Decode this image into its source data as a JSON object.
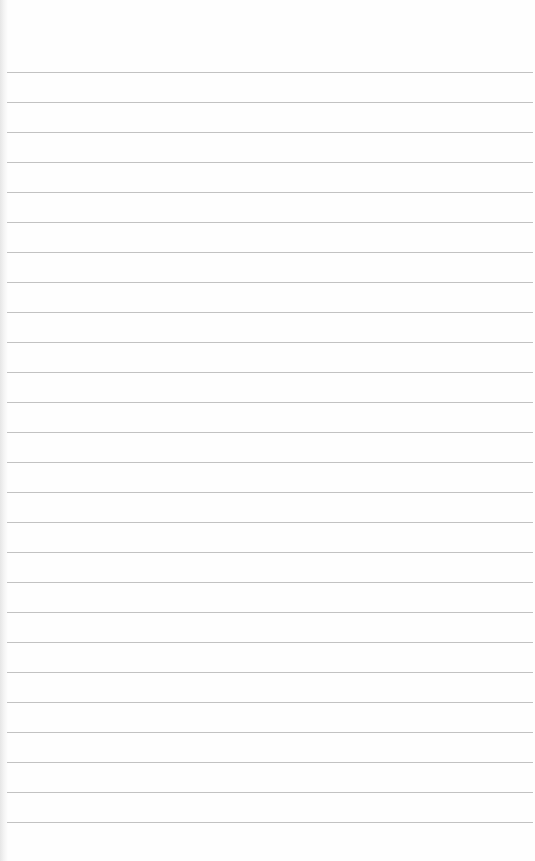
{
  "page": {
    "type": "ruled-notepad",
    "background_color": "#fefefe",
    "line_color": "#c2c2c2",
    "line_count": 26,
    "first_line_y": 72,
    "line_spacing": 30,
    "text": ""
  }
}
